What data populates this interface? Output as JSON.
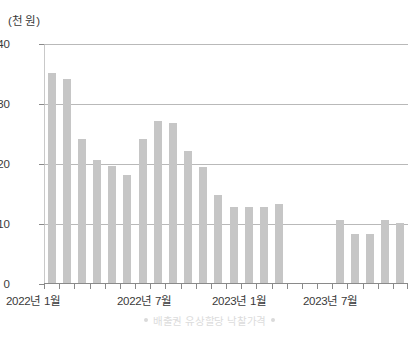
{
  "chart_data": {
    "type": "bar",
    "title": "",
    "unit_label": "(천 원)",
    "xlabel": "",
    "ylabel": "",
    "ylim": [
      0,
      40
    ],
    "yticks": [
      0,
      10,
      20,
      30,
      40
    ],
    "grid": true,
    "legend_position": "bottom",
    "legend": [
      "배출권 유상할당 낙찰가격"
    ],
    "x_tick_labels": [
      "2022년 1월",
      "2022년 7월",
      "2023년 1월",
      "2023년 7월"
    ],
    "x_tick_label_index": [
      0,
      6,
      12,
      18
    ],
    "categories": [
      "2022-01",
      "2022-02",
      "2022-03",
      "2022-04",
      "2022-05",
      "2022-06",
      "2022-07",
      "2022-08",
      "2022-09",
      "2022-10",
      "2022-11",
      "2022-12",
      "2023-01",
      "2023-02",
      "2023-03",
      "2023-04",
      "2023-05",
      "2023-06",
      "2023-07",
      "2023-08",
      "2023-09",
      "2023-10",
      "2023-11",
      "2023-12"
    ],
    "series": [
      {
        "name": "배출권 유상할당 낙찰가격",
        "color": "#c6c6c6",
        "values": [
          35.2,
          34.1,
          24.1,
          20.7,
          19.6,
          18.2,
          24.1,
          27.2,
          26.9,
          22.1,
          19.5,
          14.8,
          12.9,
          12.9,
          12.9,
          13.4,
          null,
          null,
          null,
          10.6,
          8.3,
          8.3,
          10.6,
          10.1
        ]
      }
    ]
  },
  "axis": {
    "y_tick_0": "0",
    "y_tick_1": "10",
    "y_tick_2": "20",
    "y_tick_3": "30",
    "y_tick_4": "40"
  },
  "xlabels": {
    "l0": "2022년 1월",
    "l1": "2022년 7월",
    "l2": "2023년 1월",
    "l3": "2023년 7월"
  },
  "legend": {
    "text": "배출권 유상할당 낙찰가격"
  }
}
